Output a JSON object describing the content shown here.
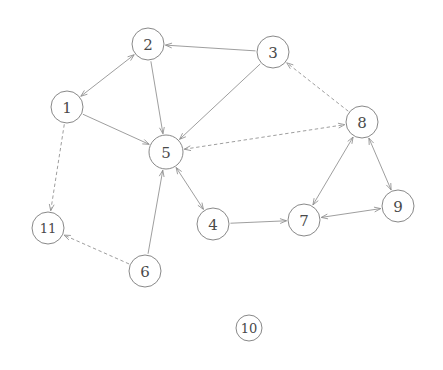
{
  "diagram": {
    "width": 443,
    "height": 370,
    "background_color": "#ffffff",
    "node_stroke_color": "#7a7a7a",
    "node_fill_color": "#ffffff",
    "edge_color": "#8c8c8c",
    "label_color": "#4a4a4a",
    "node_radius": 15,
    "nodes": [
      {
        "id": "1",
        "label": "1",
        "x": 67,
        "y": 107,
        "r": 16
      },
      {
        "id": "2",
        "label": "2",
        "x": 148,
        "y": 44,
        "r": 16
      },
      {
        "id": "3",
        "label": "3",
        "x": 273,
        "y": 52,
        "r": 16
      },
      {
        "id": "4",
        "label": "4",
        "x": 213,
        "y": 224,
        "r": 16
      },
      {
        "id": "5",
        "label": "5",
        "x": 166,
        "y": 152,
        "r": 17
      },
      {
        "id": "6",
        "label": "6",
        "x": 145,
        "y": 271,
        "r": 16
      },
      {
        "id": "7",
        "label": "7",
        "x": 304,
        "y": 220,
        "r": 16
      },
      {
        "id": "8",
        "label": "8",
        "x": 362,
        "y": 122,
        "r": 16
      },
      {
        "id": "9",
        "label": "9",
        "x": 398,
        "y": 206,
        "r": 16
      },
      {
        "id": "10",
        "label": "10",
        "x": 249,
        "y": 328,
        "r": 13
      },
      {
        "id": "11",
        "label": "11",
        "x": 48,
        "y": 228,
        "r": 16
      }
    ],
    "edges": [
      {
        "from": "1",
        "to": "2",
        "style": "solid",
        "direction": "both"
      },
      {
        "from": "3",
        "to": "2",
        "style": "solid",
        "direction": "forward"
      },
      {
        "from": "2",
        "to": "5",
        "style": "solid",
        "direction": "forward"
      },
      {
        "from": "1",
        "to": "5",
        "style": "solid",
        "direction": "forward"
      },
      {
        "from": "3",
        "to": "5",
        "style": "solid",
        "direction": "forward"
      },
      {
        "from": "1",
        "to": "11",
        "style": "dashed",
        "direction": "forward"
      },
      {
        "from": "6",
        "to": "11",
        "style": "dashed",
        "direction": "forward"
      },
      {
        "from": "6",
        "to": "5",
        "style": "solid",
        "direction": "forward"
      },
      {
        "from": "5",
        "to": "4",
        "style": "solid",
        "direction": "both"
      },
      {
        "from": "4",
        "to": "7",
        "style": "solid",
        "direction": "forward"
      },
      {
        "from": "7",
        "to": "8",
        "style": "solid",
        "direction": "both"
      },
      {
        "from": "8",
        "to": "9",
        "style": "solid",
        "direction": "both"
      },
      {
        "from": "7",
        "to": "9",
        "style": "solid",
        "direction": "both"
      },
      {
        "from": "5",
        "to": "8",
        "style": "dashed",
        "direction": "both"
      },
      {
        "from": "8",
        "to": "3",
        "style": "dashed",
        "direction": "forward"
      }
    ],
    "isolated_nodes": [
      "10"
    ]
  }
}
